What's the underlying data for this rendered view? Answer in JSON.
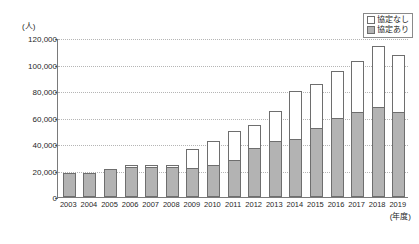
{
  "chart_data": {
    "type": "bar",
    "subtype": "stacked-vertical-bar",
    "title": "",
    "xlabel": "(年度)",
    "ylabel": "(人)",
    "ylim": [
      0,
      120000
    ],
    "ytick_interval": 20000,
    "ytick_labels": [
      "120,000",
      "100,000",
      "80,000",
      "60,000",
      "40,000",
      "20,000",
      "0"
    ],
    "ytick_values": [
      120000,
      100000,
      80000,
      60000,
      40000,
      20000,
      0
    ],
    "grid": true,
    "legend_position": "top-right",
    "categories": [
      "2003",
      "2004",
      "2005",
      "2006",
      "2007",
      "2008",
      "2009",
      "2010",
      "2011",
      "2012",
      "2013",
      "2014",
      "2015",
      "2016",
      "2017",
      "2018",
      "2019"
    ],
    "series": [
      {
        "name": "協定あり",
        "color": "#b3b3b3",
        "stack_position": "bottom",
        "values": [
          18000,
          18000,
          21000,
          23000,
          23000,
          23000,
          22000,
          24000,
          28000,
          37000,
          42000,
          44000,
          52000,
          60000,
          64000,
          68000,
          64000
        ]
      },
      {
        "name": "協定なし",
        "color": "#ffffff",
        "stack_position": "top",
        "values": [
          0,
          0,
          0,
          1000,
          1000,
          1000,
          14000,
          18000,
          22000,
          17000,
          23000,
          36000,
          33000,
          35000,
          39000,
          46000,
          43000
        ]
      }
    ],
    "totals": [
      18000,
      18000,
      21000,
      24000,
      24000,
      24000,
      36000,
      42000,
      50000,
      54000,
      65000,
      80000,
      85000,
      95000,
      103000,
      114000,
      107000
    ]
  },
  "legend": {
    "items": [
      {
        "label": "協定なし",
        "swatch": "white-square"
      },
      {
        "label": "協定あり",
        "swatch": "gray-square"
      }
    ]
  },
  "axes": {
    "y_unit": "(人)",
    "x_unit": "(年度)"
  }
}
